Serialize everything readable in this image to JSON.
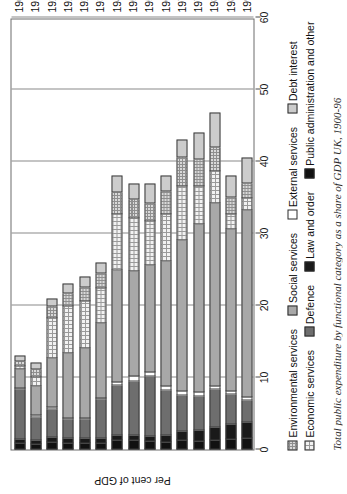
{
  "axes": {
    "value_axis_title": "Per cent of GDP",
    "value_ticks": [
      "0",
      "10",
      "20",
      "30",
      "40",
      "50",
      "60"
    ],
    "value_min": 0,
    "value_max": 60
  },
  "legend": {
    "row1": [
      {
        "key": "environmental",
        "label": "Environmental services",
        "color": "#d9d9d9"
      },
      {
        "key": "social",
        "label": "Social services",
        "color": "#a8a8a8"
      },
      {
        "key": "external",
        "label": "External services",
        "color": "#ffffff"
      },
      {
        "key": "debt",
        "label": "Debt interest",
        "color": "#cccccc"
      }
    ],
    "row2": [
      {
        "key": "economic",
        "label": "Economic services",
        "color": "#f2f2f2"
      },
      {
        "key": "defence",
        "label": "Defence",
        "color": "#6e6e6e"
      },
      {
        "key": "law",
        "label": "Law and order",
        "color": "#1a1a1a"
      },
      {
        "key": "public",
        "label": "Public administration and other",
        "color": "#111111"
      }
    ]
  },
  "caption": "Total public expenditure by functional category as a share of GDP UK, 1900-96",
  "chart_data": {
    "type": "bar",
    "title": "",
    "subtitle": "",
    "xlabel": "",
    "ylabel": "Per cent of GDP",
    "ylim": [
      0,
      60
    ],
    "grid": true,
    "orientation": "horizontal-stacked",
    "legend_position": "below",
    "categories": [
      "1900",
      "1913",
      "1920",
      "1924",
      "1929",
      "1937",
      "1948",
      "1951",
      "1955",
      "1964",
      "1973",
      "1979",
      "1982",
      "1989",
      "1996"
    ],
    "series": [
      {
        "name": "Public administration and other",
        "color": "#111111",
        "values": [
          0.8,
          0.7,
          1.0,
          0.9,
          0.9,
          0.9,
          1.3,
          1.2,
          1.1,
          1.0,
          1.3,
          1.1,
          1.3,
          1.4,
          1.5
        ]
      },
      {
        "name": "Law and order",
        "color": "#1a1a1a",
        "values": [
          0.6,
          0.6,
          0.6,
          0.6,
          0.6,
          0.6,
          0.6,
          0.7,
          0.7,
          0.9,
          1.2,
          1.5,
          1.8,
          2.1,
          2.3
        ]
      },
      {
        "name": "Defence",
        "color": "#6e6e6e",
        "values": [
          6.9,
          3.2,
          4.0,
          2.6,
          2.6,
          5.4,
          7.0,
          7.6,
          8.4,
          6.3,
          5.0,
          4.7,
          5.2,
          4.1,
          3.0
        ]
      },
      {
        "name": "External services",
        "color": "#ffffff",
        "values": [
          0.1,
          0.1,
          0.2,
          0.2,
          0.2,
          0.2,
          0.4,
          0.6,
          0.5,
          0.6,
          0.5,
          0.6,
          0.5,
          0.4,
          0.4
        ]
      },
      {
        "name": "Social services",
        "color": "#a8a8a8",
        "values": [
          2.6,
          4.1,
          6.9,
          9.0,
          9.7,
          10.4,
          15.6,
          14.6,
          14.8,
          17.3,
          21.0,
          23.3,
          25.4,
          22.5,
          26.0
        ]
      },
      {
        "name": "Economic services",
        "color": "#f2f2f2",
        "values": [
          0.5,
          1.2,
          5.5,
          6.5,
          6.5,
          4.9,
          7.8,
          7.4,
          6.2,
          6.5,
          7.6,
          5.3,
          4.4,
          2.1,
          1.6
        ]
      },
      {
        "name": "Environmental services",
        "color": "#d9d9d9",
        "values": [
          0.6,
          1.1,
          1.6,
          1.9,
          2.0,
          2.1,
          3.0,
          2.6,
          2.5,
          3.2,
          3.9,
          3.8,
          3.3,
          2.4,
          2.2
        ]
      },
      {
        "name": "Debt interest",
        "color": "#cccccc",
        "values": [
          0.9,
          1.0,
          1.2,
          1.3,
          1.5,
          1.5,
          2.3,
          2.3,
          2.8,
          2.2,
          2.5,
          3.7,
          4.9,
          3.0,
          3.5
        ]
      }
    ],
    "totals": [
      13.0,
      12.0,
      21.0,
      23.0,
      24.0,
      26.0,
      38.0,
      37.0,
      37.0,
      38.0,
      43.0,
      44.0,
      46.8,
      38.0,
      40.5
    ]
  },
  "stack_order": [
    "public",
    "law",
    "defence",
    "external",
    "social",
    "economic",
    "environmental",
    "debt"
  ]
}
